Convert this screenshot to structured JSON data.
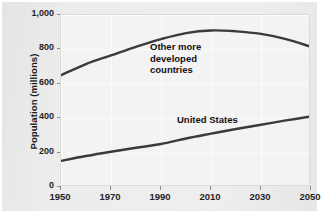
{
  "chart_data": {
    "type": "line",
    "title": "",
    "subtitle": "",
    "xlabel": "",
    "ylabel": "Population (millions)",
    "xlim": [
      1950,
      2050
    ],
    "ylim": [
      0,
      1000
    ],
    "grid": true,
    "legend_position": "inline-annotations",
    "x_ticks": [
      "1950",
      "1970",
      "1990",
      "2010",
      "2030",
      "2050"
    ],
    "x_tick_values": [
      1950,
      1970,
      1990,
      2010,
      2030,
      2050
    ],
    "y_ticks": [
      "0",
      "200",
      "400",
      "600",
      "800",
      "1,000"
    ],
    "y_tick_values": [
      0,
      200,
      400,
      600,
      800,
      1000
    ],
    "series": [
      {
        "name": "Other more developed countries",
        "color": "#3a3a3a",
        "x": [
          1950,
          1960,
          1970,
          1980,
          1990,
          2000,
          2010,
          2020,
          2030,
          2040,
          2050
        ],
        "values": [
          650,
          715,
          765,
          815,
          860,
          895,
          910,
          905,
          890,
          860,
          815
        ]
      },
      {
        "name": "United States",
        "color": "#3a3a3a",
        "x": [
          1950,
          1960,
          1970,
          1980,
          1990,
          2000,
          2010,
          2020,
          2030,
          2040,
          2050
        ],
        "values": [
          152,
          180,
          205,
          228,
          250,
          282,
          310,
          337,
          362,
          387,
          410
        ]
      }
    ],
    "annotations": [
      {
        "text": "Other more\ndeveloped\ncountries",
        "series": "Other more developed countries"
      },
      {
        "text": "United States",
        "series": "United States"
      }
    ]
  },
  "colors": {
    "figure_background": "#ebebeb",
    "plot_background": "#f3f3f3",
    "gridline": "#fbfbfb",
    "line": "#3a3a3a",
    "text": "#1a1a1a"
  }
}
